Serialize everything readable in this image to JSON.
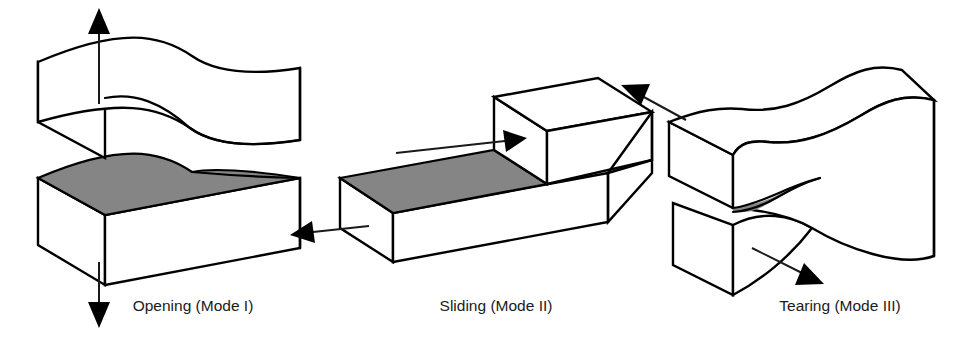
{
  "figure": {
    "background_color": "#ffffff",
    "line_color": "#000000",
    "crack_surface_color": "#858585",
    "text_color": "#1a1a1a"
  },
  "modes": [
    {
      "id": "mode-1",
      "label": "Opening (Mode I)",
      "label_x": 193,
      "label_y": 311,
      "arrows": [
        {
          "name": "up-arrow",
          "direction": "up"
        },
        {
          "name": "down-arrow",
          "direction": "down"
        }
      ],
      "crack_surface": "shaded-horizontal-plane",
      "icons": [
        "arrow-up-icon",
        "arrow-down-icon"
      ]
    },
    {
      "id": "mode-2",
      "label": "Sliding (Mode II)",
      "label_x": 496,
      "label_y": 311,
      "arrows": [
        {
          "name": "upper-right-arrow",
          "direction": "right"
        },
        {
          "name": "lower-left-arrow",
          "direction": "left"
        }
      ],
      "crack_surface": "shaded-horizontal-plane",
      "icons": [
        "arrow-right-icon",
        "arrow-left-icon"
      ]
    },
    {
      "id": "mode-3",
      "label": "Tearing (Mode III)",
      "label_x": 840,
      "label_y": 311,
      "arrows": [
        {
          "name": "upper-left-arrow",
          "direction": "upper-left"
        },
        {
          "name": "lower-right-arrow",
          "direction": "lower-right"
        }
      ],
      "crack_surface": "shaded-wedge",
      "icons": [
        "arrow-upper-left-icon",
        "arrow-lower-right-icon"
      ]
    }
  ]
}
